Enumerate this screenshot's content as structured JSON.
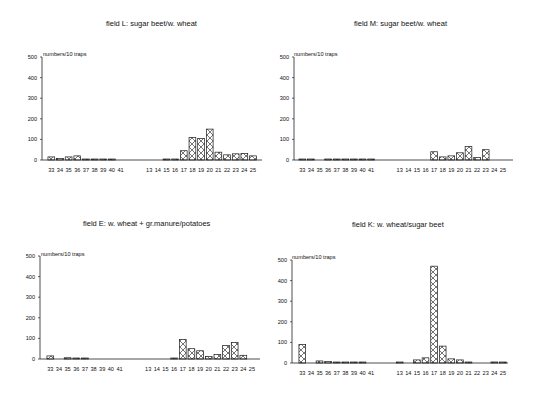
{
  "chart_data": [
    {
      "type": "bar",
      "title": "field L: sugar beet/w. wheat",
      "ylabel": "numbers/10 traps",
      "xlabel": "",
      "ylim": [
        0,
        500
      ],
      "yticks": [
        0,
        100,
        200,
        300,
        400,
        500
      ],
      "categories": [
        "33",
        "34",
        "35",
        "36",
        "37",
        "38",
        "39",
        "40",
        "41",
        "13",
        "14",
        "15",
        "16",
        "17",
        "18",
        "19",
        "20",
        "21",
        "22",
        "23",
        "24",
        "25"
      ],
      "series": [
        {
          "name": "sparse hatch",
          "values": [
            15,
            8,
            15,
            20,
            3,
            3,
            1,
            1,
            0,
            0,
            0,
            1,
            2,
            0,
            0,
            0,
            0,
            0,
            0,
            0,
            0,
            0
          ]
        },
        {
          "name": "dense hatch",
          "values": [
            0,
            0,
            0,
            0,
            0,
            0,
            0,
            0,
            0,
            0,
            0,
            0,
            0,
            45,
            110,
            105,
            150,
            38,
            25,
            30,
            32,
            20
          ]
        }
      ],
      "values": [
        15,
        8,
        15,
        20,
        3,
        3,
        1,
        1,
        0,
        0,
        0,
        1,
        2,
        45,
        110,
        105,
        150,
        38,
        25,
        30,
        32,
        20
      ],
      "grid": false
    },
    {
      "type": "bar",
      "title": "field M: sugar beet/w. wheat",
      "ylabel": "numbers/10 traps",
      "xlabel": "",
      "ylim": [
        0,
        500
      ],
      "yticks": [
        0,
        100,
        200,
        300,
        400,
        500
      ],
      "categories": [
        "33",
        "34",
        "35",
        "36",
        "37",
        "38",
        "39",
        "40",
        "41",
        "13",
        "14",
        "15",
        "16",
        "17",
        "18",
        "19",
        "20",
        "21",
        "22",
        "23",
        "24",
        "25"
      ],
      "values": [
        2,
        3,
        0,
        2,
        2,
        1,
        1,
        1,
        1,
        0,
        0,
        0,
        0,
        40,
        15,
        20,
        35,
        65,
        12,
        50,
        0,
        0
      ],
      "grid": false
    },
    {
      "type": "bar",
      "title": "field E: w. wheat + gr.manure/potatoes",
      "ylabel": "numbers/10 traps",
      "xlabel": "",
      "ylim": [
        0,
        500
      ],
      "yticks": [
        0,
        100,
        200,
        300,
        400,
        500
      ],
      "categories": [
        "33",
        "34",
        "35",
        "36",
        "37",
        "38",
        "39",
        "40",
        "41",
        "13",
        "14",
        "15",
        "16",
        "17",
        "18",
        "19",
        "20",
        "21",
        "22",
        "23",
        "24",
        "25"
      ],
      "values": [
        15,
        0,
        6,
        1,
        2,
        0,
        0,
        0,
        0,
        0,
        0,
        0,
        3,
        95,
        50,
        40,
        12,
        22,
        65,
        80,
        18,
        0
      ],
      "grid": false
    },
    {
      "type": "bar",
      "title": "field K: w. wheat/sugar beet",
      "ylabel": "numbers/10 traps",
      "xlabel": "",
      "ylim": [
        0,
        500
      ],
      "yticks": [
        0,
        100,
        200,
        300,
        400,
        500
      ],
      "categories": [
        "33",
        "34",
        "35",
        "36",
        "37",
        "38",
        "39",
        "40",
        "41",
        "13",
        "14",
        "15",
        "16",
        "17",
        "18",
        "19",
        "20",
        "21",
        "22",
        "23",
        "24",
        "25"
      ],
      "values": [
        90,
        0,
        10,
        7,
        2,
        2,
        2,
        2,
        0,
        3,
        0,
        15,
        25,
        470,
        82,
        20,
        15,
        3,
        0,
        0,
        5,
        4
      ],
      "grid": false
    }
  ],
  "panels": [
    {
      "title": "field L: sugar beet/w. wheat",
      "ylabel": "numbers/10 traps"
    },
    {
      "title": "field M: sugar beet/w. wheat",
      "ylabel": "numbers/10 traps"
    },
    {
      "title": "field E: w. wheat + gr.manure/potatoes",
      "ylabel": "numbers/10 traps"
    },
    {
      "title": "field K: w. wheat/sugar beet",
      "ylabel": "numbers/10 traps"
    }
  ],
  "style": {
    "bar_stroke": "#1a1a1a",
    "axis_color": "#222222",
    "background": "#ffffff"
  }
}
